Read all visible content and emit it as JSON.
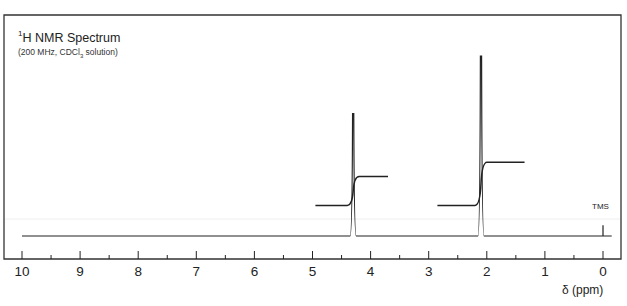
{
  "chart_data": {
    "type": "line",
    "title": "1H NMR Spectrum",
    "title_parts": {
      "sup": "1",
      "main": "H NMR Spectrum"
    },
    "subtitle": "(200 MHz, CDCl3 solution)",
    "subtitle_parts": {
      "pre": "(200 MHz, CDCl",
      "sub": "3",
      "post": " solution)"
    },
    "xlabel": "δ (ppm)",
    "ylabel": "",
    "xlim": [
      10,
      0
    ],
    "x_reversed": true,
    "xticks": [
      10,
      9,
      8,
      7,
      6,
      5,
      4,
      3,
      2,
      1,
      0
    ],
    "minor_tick_step": 0.5,
    "grid": false,
    "peaks": [
      {
        "shift_ppm": 4.3,
        "relative_height": 0.68,
        "label": ""
      },
      {
        "shift_ppm": 2.1,
        "relative_height": 1.0,
        "label": ""
      },
      {
        "shift_ppm": 0.0,
        "relative_height": 0.06,
        "label": "TMS"
      }
    ],
    "integrals": [
      {
        "from_ppm": 4.95,
        "to_ppm": 3.7,
        "center_ppm": 4.3,
        "start_level": 0.17,
        "end_level": 0.33,
        "step": 0.16
      },
      {
        "from_ppm": 2.85,
        "to_ppm": 1.35,
        "center_ppm": 2.1,
        "start_level": 0.17,
        "end_level": 0.41,
        "step": 0.24
      }
    ],
    "annotations": [
      "TMS"
    ]
  },
  "colors": {
    "line": "#222222",
    "background": "#ffffff",
    "frame": "#333333"
  }
}
